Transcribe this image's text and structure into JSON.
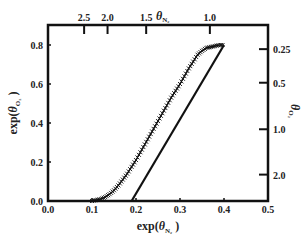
{
  "chart_data": {
    "type": "line",
    "title": "",
    "xlabel": "exp(θ_N2)",
    "ylabel": "exp(θ_O2)",
    "top_axis_label": "θ_N2",
    "right_axis_label": "θ_O2",
    "xlim": [
      0.0,
      0.5
    ],
    "ylim": [
      0.0,
      0.9
    ],
    "x_ticks": [
      "0.0",
      "0.1",
      "0.2",
      "0.3",
      "0.4",
      "0.5"
    ],
    "y_ticks": [
      "0.0",
      "0.2",
      "0.4",
      "0.6",
      "0.8"
    ],
    "top_ticks": [
      "2.5",
      "2.0",
      "1.5",
      "1.0"
    ],
    "right_ticks": [
      "0.25",
      "0.5",
      "1.0",
      "2.0"
    ],
    "grid": false,
    "series": [
      {
        "name": "markers (x)",
        "style": "cross-markers",
        "x": [
          0.1,
          0.11,
          0.12,
          0.13,
          0.14,
          0.15,
          0.16,
          0.17,
          0.18,
          0.19,
          0.2,
          0.21,
          0.22,
          0.23,
          0.24,
          0.25,
          0.26,
          0.27,
          0.28,
          0.29,
          0.3,
          0.31,
          0.32,
          0.33,
          0.34,
          0.35,
          0.36,
          0.37,
          0.38,
          0.39,
          0.4
        ],
        "y": [
          0.0,
          0.005,
          0.01,
          0.02,
          0.035,
          0.055,
          0.08,
          0.11,
          0.14,
          0.175,
          0.21,
          0.25,
          0.29,
          0.33,
          0.37,
          0.41,
          0.45,
          0.49,
          0.53,
          0.565,
          0.6,
          0.64,
          0.68,
          0.715,
          0.75,
          0.77,
          0.785,
          0.79,
          0.795,
          0.8,
          0.8
        ]
      },
      {
        "name": "linear fit",
        "style": "solid-line",
        "x": [
          0.19,
          0.4
        ],
        "y": [
          0.0,
          0.8
        ]
      }
    ]
  }
}
